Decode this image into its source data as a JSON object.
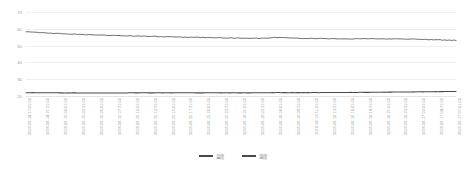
{
  "chart_data": {
    "type": "line",
    "title": "",
    "xlabel": "",
    "ylabel": "",
    "ylim": [
      20,
      70
    ],
    "yticks": [
      70,
      60,
      50,
      40,
      30,
      20
    ],
    "grid": true,
    "legend_position": "bottom-center",
    "x": [
      "2018-06-14 17:01:00",
      "2018-06-14 21:31:00",
      "2018-06-15 00:01:00",
      "2018-06-15 02:31:00",
      "2018-06-15 05:01:00",
      "2018-06-15 07:31:00",
      "2018-06-15 10:01:00",
      "2018-06-15 12:31:00",
      "2018-06-15 15:01:00",
      "2018-06-15 17:31:00",
      "2018-06-15 20:01:00",
      "2018-06-15 22:31:00",
      "2018-06-16 01:01:00",
      "2018-06-16 03:31:00",
      "2018-06-16 06:01:00",
      "2018-06-16 08:31:00",
      "2018-06-16 11:01:00",
      "2018-06-16 13:31:00",
      "2018-06-16 16:01:00",
      "2018-06-16 18:31:00",
      "2018-06-16 21:01:00",
      "2018-06-16 23:31:00",
      "2018-06-17 02:01:00",
      "2018-06-17 04:31:00",
      "2018-06-17 07:01:00"
    ],
    "series": [
      {
        "name": "温度",
        "color": "#4a4a4a",
        "values": [
          22.0,
          21.9,
          21.9,
          21.8,
          21.8,
          21.8,
          21.9,
          21.9,
          21.9,
          21.9,
          21.9,
          21.9,
          21.9,
          21.9,
          22.0,
          22.0,
          22.0,
          22.1,
          22.1,
          22.2,
          22.3,
          22.4,
          22.5,
          22.6,
          22.7
        ]
      },
      {
        "name": "湿度",
        "color": "#4a4a4a",
        "values": [
          58.2,
          57.6,
          57.1,
          56.7,
          56.3,
          56.0,
          55.7,
          55.5,
          55.2,
          55.0,
          54.8,
          54.6,
          54.4,
          54.3,
          54.9,
          54.4,
          54.2,
          54.1,
          54.0,
          54.1,
          53.9,
          54.0,
          53.7,
          53.4,
          53.1
        ]
      }
    ]
  },
  "legend": {
    "items": [
      {
        "label": "温度"
      },
      {
        "label": "湿度"
      }
    ]
  }
}
